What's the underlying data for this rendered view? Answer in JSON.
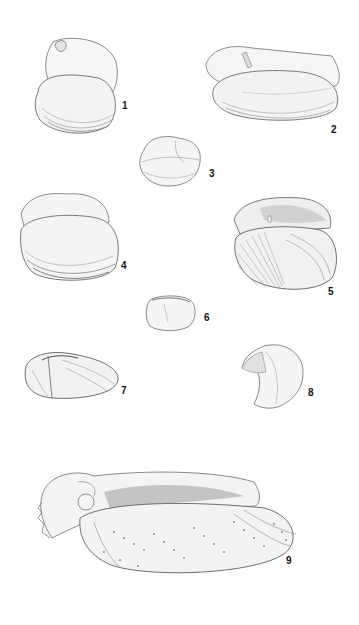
{
  "plate": {
    "background": "#ffffff",
    "ink_color": "#6a6a6a",
    "figures": [
      {
        "id": "fig-1",
        "label": "1",
        "description": "bivalve shell, rounded, two valves open, interior and exterior view"
      },
      {
        "id": "fig-2",
        "label": "2",
        "description": "elongate bivalve with radial ribbing, hinge visible"
      },
      {
        "id": "fig-3",
        "label": "3",
        "description": "small rounded-quadrate bivalve"
      },
      {
        "id": "fig-4",
        "label": "4",
        "description": "rounded bivalve, interior view with growth lines"
      },
      {
        "id": "fig-5",
        "label": "5",
        "description": "bivalve with cross-hatched radial sculpture, hinge tooth visible"
      },
      {
        "id": "fig-6",
        "label": "6",
        "description": "small oval bivalve"
      },
      {
        "id": "fig-7",
        "label": "7",
        "description": "elongate ovate bivalve with radial sculpture"
      },
      {
        "id": "fig-8",
        "label": "8",
        "description": "hooked / boot-shaped bivalve valve"
      },
      {
        "id": "fig-9",
        "label": "9",
        "description": "large elongate ark-shell with beaded radial ribs, wing-like anterior"
      }
    ]
  }
}
